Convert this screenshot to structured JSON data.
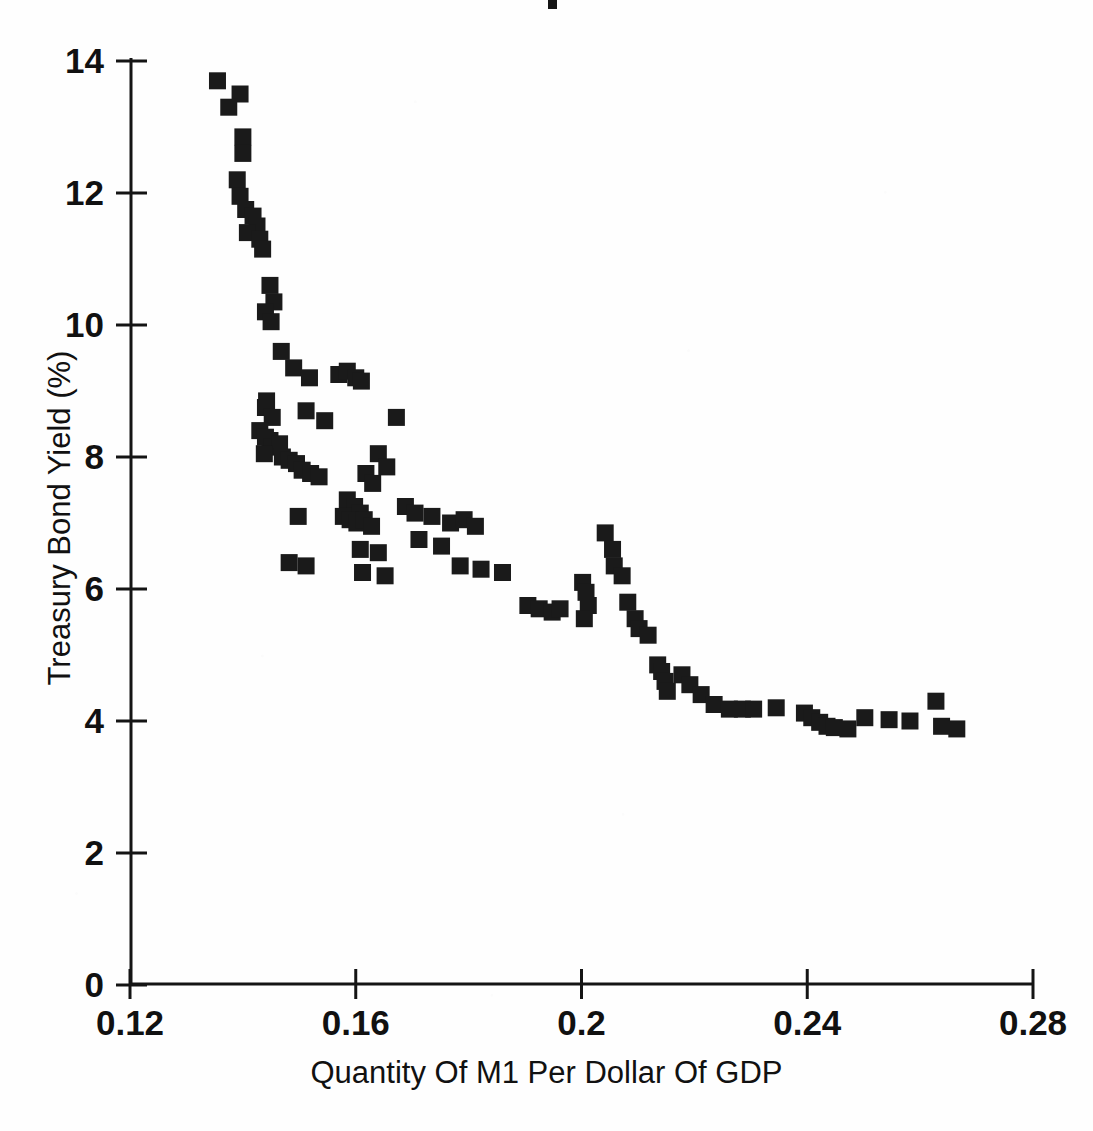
{
  "figure": {
    "width": 1093,
    "height": 1131,
    "background_color": "#ffffff",
    "ink_color": "#1a1a1a"
  },
  "axes": {
    "x_title": "Quantity Of M1 Per Dollar Of GDP",
    "y_title": "Treasury Bond Yield (%)",
    "x_ticks": [
      "0.12",
      "0.16",
      "0.2",
      "0.24",
      "0.28"
    ],
    "y_ticks": [
      "0",
      "2",
      "4",
      "6",
      "8",
      "10",
      "12",
      "14"
    ]
  },
  "chart_data": {
    "type": "scatter",
    "title": "",
    "xlabel": "Quantity Of M1 Per Dollar Of GDP",
    "ylabel": "Treasury Bond Yield (%)",
    "xlim": [
      0.12,
      0.28
    ],
    "ylim": [
      0,
      14
    ],
    "xticks": [
      0.12,
      0.16,
      0.2,
      0.24,
      0.28
    ],
    "yticks": [
      0,
      2,
      4,
      6,
      8,
      10,
      12,
      14
    ],
    "grid": false,
    "legend": null,
    "marker": "square",
    "marker_color": "#1a1a1a",
    "series": [
      {
        "name": "Treasury Bond Yield vs M1/GDP",
        "points": [
          [
            0.1355,
            13.7
          ],
          [
            0.1395,
            13.5
          ],
          [
            0.1375,
            13.3
          ],
          [
            0.14,
            12.85
          ],
          [
            0.14,
            12.6
          ],
          [
            0.139,
            12.2
          ],
          [
            0.1395,
            11.95
          ],
          [
            0.1405,
            11.75
          ],
          [
            0.1418,
            11.65
          ],
          [
            0.1425,
            11.5
          ],
          [
            0.1408,
            11.4
          ],
          [
            0.143,
            11.3
          ],
          [
            0.1435,
            11.15
          ],
          [
            0.1448,
            10.6
          ],
          [
            0.1455,
            10.35
          ],
          [
            0.144,
            10.2
          ],
          [
            0.145,
            10.05
          ],
          [
            0.1468,
            9.6
          ],
          [
            0.149,
            9.35
          ],
          [
            0.1518,
            9.2
          ],
          [
            0.157,
            9.25
          ],
          [
            0.1585,
            9.3
          ],
          [
            0.16,
            9.2
          ],
          [
            0.161,
            9.15
          ],
          [
            0.1442,
            8.85
          ],
          [
            0.144,
            8.75
          ],
          [
            0.1452,
            8.6
          ],
          [
            0.1512,
            8.7
          ],
          [
            0.1545,
            8.55
          ],
          [
            0.143,
            8.4
          ],
          [
            0.144,
            8.3
          ],
          [
            0.1448,
            8.25
          ],
          [
            0.1452,
            8.15
          ],
          [
            0.1465,
            8.2
          ],
          [
            0.1438,
            8.05
          ],
          [
            0.147,
            8.0
          ],
          [
            0.1482,
            7.95
          ],
          [
            0.1495,
            7.9
          ],
          [
            0.1505,
            7.8
          ],
          [
            0.152,
            7.75
          ],
          [
            0.1535,
            7.7
          ],
          [
            0.1672,
            8.6
          ],
          [
            0.164,
            8.05
          ],
          [
            0.1655,
            7.85
          ],
          [
            0.1618,
            7.75
          ],
          [
            0.163,
            7.6
          ],
          [
            0.1585,
            7.35
          ],
          [
            0.1598,
            7.25
          ],
          [
            0.1608,
            7.15
          ],
          [
            0.1578,
            7.1
          ],
          [
            0.159,
            7.05
          ],
          [
            0.1602,
            7.0
          ],
          [
            0.1615,
            7.05
          ],
          [
            0.1628,
            6.95
          ],
          [
            0.1498,
            7.1
          ],
          [
            0.1482,
            6.4
          ],
          [
            0.1512,
            6.35
          ],
          [
            0.1608,
            6.6
          ],
          [
            0.164,
            6.55
          ],
          [
            0.1612,
            6.25
          ],
          [
            0.1652,
            6.2
          ],
          [
            0.1688,
            7.25
          ],
          [
            0.1705,
            7.15
          ],
          [
            0.1735,
            7.1
          ],
          [
            0.1768,
            7.0
          ],
          [
            0.1792,
            7.05
          ],
          [
            0.1812,
            6.95
          ],
          [
            0.1752,
            6.65
          ],
          [
            0.1785,
            6.35
          ],
          [
            0.1822,
            6.3
          ],
          [
            0.186,
            6.25
          ],
          [
            0.1712,
            6.75
          ],
          [
            0.1905,
            5.75
          ],
          [
            0.1925,
            5.7
          ],
          [
            0.1948,
            5.65
          ],
          [
            0.1962,
            5.7
          ],
          [
            0.2002,
            6.1
          ],
          [
            0.2008,
            5.95
          ],
          [
            0.2012,
            5.75
          ],
          [
            0.2005,
            5.55
          ],
          [
            0.2042,
            6.85
          ],
          [
            0.2055,
            6.6
          ],
          [
            0.2058,
            6.35
          ],
          [
            0.2072,
            6.2
          ],
          [
            0.2082,
            5.8
          ],
          [
            0.2095,
            5.55
          ],
          [
            0.2102,
            5.4
          ],
          [
            0.2118,
            5.3
          ],
          [
            0.2135,
            4.85
          ],
          [
            0.2142,
            4.75
          ],
          [
            0.2148,
            4.6
          ],
          [
            0.2152,
            4.45
          ],
          [
            0.2178,
            4.7
          ],
          [
            0.2192,
            4.55
          ],
          [
            0.2212,
            4.4
          ],
          [
            0.2235,
            4.25
          ],
          [
            0.2262,
            4.18
          ],
          [
            0.2285,
            4.18
          ],
          [
            0.2305,
            4.18
          ],
          [
            0.2345,
            4.2
          ],
          [
            0.2395,
            4.12
          ],
          [
            0.2408,
            4.05
          ],
          [
            0.2422,
            3.98
          ],
          [
            0.2435,
            3.92
          ],
          [
            0.2448,
            3.9
          ],
          [
            0.2472,
            3.88
          ],
          [
            0.2502,
            4.05
          ],
          [
            0.2545,
            4.02
          ],
          [
            0.2582,
            4.0
          ],
          [
            0.2628,
            4.3
          ],
          [
            0.2638,
            3.92
          ],
          [
            0.2665,
            3.88
          ]
        ]
      }
    ]
  }
}
